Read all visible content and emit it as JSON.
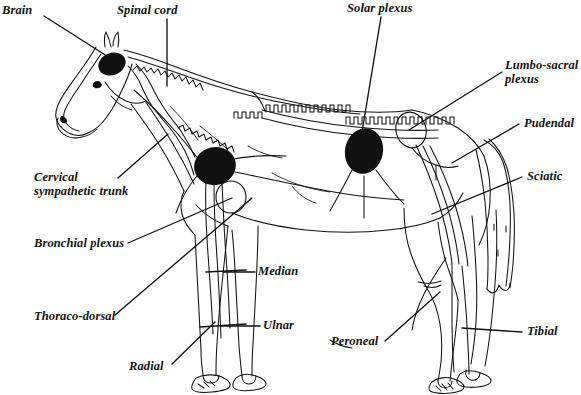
{
  "figure": {
    "style": "black-and-white line drawing",
    "background_color": "#ffffff",
    "ink_color": "#111111",
    "width": 581,
    "height": 395
  },
  "labels": [
    {
      "id": "brain",
      "text": "Brain",
      "lines": [
        "Brain"
      ],
      "x": 2,
      "y": 4,
      "anchor": "left",
      "leader_from": [
        44,
        16
      ],
      "leader_to": [
        110,
        58
      ]
    },
    {
      "id": "spinal-cord",
      "text": "Spinal cord",
      "lines": [
        "Spinal cord"
      ],
      "x": 117,
      "y": 4,
      "anchor": "left",
      "leader_from": [
        167,
        19
      ],
      "leader_to": [
        167,
        86
      ]
    },
    {
      "id": "solar-plexus",
      "text": "Solar plexus",
      "lines": [
        "Solar plexus"
      ],
      "x": 347,
      "y": 2,
      "anchor": "left",
      "leader_from": [
        381,
        17
      ],
      "leader_to": [
        362,
        132
      ]
    },
    {
      "id": "lumbo-sacral-plexus",
      "text": "Lumbo-sacral plexus",
      "lines": [
        "Lumbo-sacral",
        "plexus"
      ],
      "x": 505,
      "y": 59,
      "anchor": "left",
      "leader_from": [
        502,
        72
      ],
      "leader_to": [
        409,
        130
      ]
    },
    {
      "id": "pudendal",
      "text": "Pudendal",
      "lines": [
        "Pudendal"
      ],
      "x": 524,
      "y": 117,
      "anchor": "left",
      "leader_from": [
        519,
        124
      ],
      "leader_to": [
        452,
        163
      ]
    },
    {
      "id": "sciatic",
      "text": "Sciatic",
      "lines": [
        "Sciatic"
      ],
      "x": 527,
      "y": 170,
      "anchor": "left",
      "leader_from": [
        522,
        177
      ],
      "leader_to": [
        432,
        214
      ]
    },
    {
      "id": "tibial",
      "text": "Tibial",
      "lines": [
        "Tibial"
      ],
      "x": 527,
      "y": 325,
      "anchor": "left",
      "leader_from": [
        522,
        332
      ],
      "leader_to": [
        462,
        328
      ]
    },
    {
      "id": "peroneal",
      "text": "Peroneal",
      "lines": [
        "Peroneal"
      ],
      "x": 331,
      "y": 335,
      "anchor": "left",
      "leader_from": [
        385,
        341
      ],
      "leader_to": [
        440,
        292
      ]
    },
    {
      "id": "radial",
      "text": "Radial",
      "lines": [
        "Radial"
      ],
      "x": 129,
      "y": 360,
      "anchor": "left",
      "leader_from": [
        172,
        364
      ],
      "leader_to": [
        215,
        322
      ]
    },
    {
      "id": "thoraco-dorsal",
      "text": "Thoraco-dorsal",
      "lines": [
        "Thoraco-dorsal"
      ],
      "x": 34,
      "y": 310,
      "anchor": "left",
      "leader_from": [
        115,
        315
      ],
      "leader_to": [
        252,
        198
      ]
    },
    {
      "id": "bronchial-plexus",
      "text": "Bronchial plexus",
      "lines": [
        "Bronchial plexus"
      ],
      "x": 34,
      "y": 237,
      "anchor": "left",
      "leader_from": [
        128,
        243
      ],
      "leader_to": [
        232,
        198
      ]
    },
    {
      "id": "cervical-sympathetic-trunk",
      "text": "Cervical sympathetic trunk",
      "lines": [
        "Cervical",
        "sympathetic trunk"
      ],
      "x": 34,
      "y": 171,
      "anchor": "left",
      "leader_from": [
        118,
        178
      ],
      "leader_to": [
        168,
        134
      ]
    },
    {
      "id": "median",
      "text": "Median",
      "lines": [
        "Median"
      ],
      "x": 258,
      "y": 265,
      "anchor": "left",
      "leader_from": [
        255,
        272
      ],
      "leader_to": [
        223,
        272
      ]
    },
    {
      "id": "ulnar",
      "text": "Ulnar",
      "lines": [
        "Ulnar"
      ],
      "x": 263,
      "y": 319,
      "anchor": "left",
      "leader_from": [
        260,
        326
      ],
      "leader_to": [
        221,
        326
      ]
    }
  ],
  "anatomy": {
    "filled_masses": [
      {
        "id": "brain-mass",
        "label": "Brain",
        "cx": 112,
        "cy": 64,
        "rx": 14,
        "ry": 11,
        "rotation": -22
      },
      {
        "id": "brachial-plexus-mass",
        "label": "Brachial plexus",
        "cx": 215,
        "cy": 166,
        "rx": 21,
        "ry": 19,
        "rotation": -12
      },
      {
        "id": "solar-plexus-mass",
        "label": "Solar plexus",
        "cx": 364,
        "cy": 151,
        "rx": 19,
        "ry": 23,
        "rotation": 12
      }
    ],
    "open_rings": [
      {
        "id": "lumbo-sacral-ring",
        "label": "Lumbo-sacral plexus",
        "cx": 411,
        "cy": 130,
        "rx": 15,
        "ry": 18,
        "rotation": -15
      },
      {
        "id": "shoulder-ring",
        "label": "Shoulder joint ring",
        "cx": 231,
        "cy": 197,
        "rx": 15,
        "ry": 16,
        "rotation": 0
      }
    ],
    "nerve_bands": [
      {
        "id": "median-band",
        "label": "Median",
        "x1": 206,
        "y1": 272,
        "x2": 246,
        "y2": 270
      },
      {
        "id": "ulnar-band",
        "label": "Ulnar",
        "x1": 200,
        "y1": 327,
        "x2": 246,
        "y2": 324
      }
    ]
  }
}
